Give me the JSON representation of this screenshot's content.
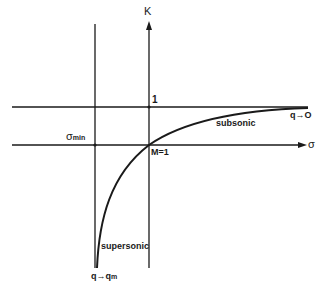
{
  "diagram": {
    "axes": {
      "vertical_label": "K",
      "horizontal_label": "σ",
      "tick_one": "1",
      "sigma_min_base": "σ",
      "sigma_min_sub": "min"
    },
    "annotations": {
      "sonic_point": "M=1",
      "subsonic": "subsonic",
      "supersonic": "supersonic",
      "q_to_zero": "q→O",
      "q_to_qm_base": "q→q",
      "q_to_qm_sub": "m"
    },
    "colors": {
      "line": "#1a1a1a",
      "background": "#ffffff"
    }
  }
}
